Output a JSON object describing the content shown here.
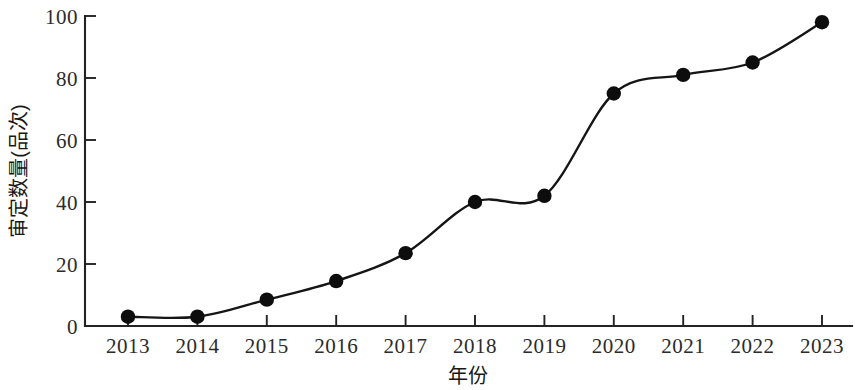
{
  "chart_data": {
    "type": "line",
    "title": "",
    "subtitle": "",
    "xlabel": "年份",
    "ylabel": "审定数量(品次)",
    "categories": [
      "2013",
      "2014",
      "2015",
      "2016",
      "2017",
      "2018",
      "2019",
      "2020",
      "2021",
      "2022",
      "2023"
    ],
    "values": [
      3,
      3,
      8.5,
      14.5,
      23.5,
      40,
      42,
      75,
      81,
      85,
      98
    ],
    "series": [
      {
        "name": "审定数量",
        "values": [
          3,
          3,
          8.5,
          14.5,
          23.5,
          40,
          42,
          75,
          81,
          85,
          98
        ]
      }
    ],
    "x_tick_labels": [
      "2013",
      "2014",
      "2015",
      "2016",
      "2017",
      "2018",
      "2019",
      "2020",
      "2021",
      "2022",
      "2023"
    ],
    "y_tick_labels": [
      "0",
      "20",
      "40",
      "60",
      "80",
      "100"
    ],
    "y_ticks": [
      0,
      20,
      40,
      60,
      80,
      100
    ],
    "ylim": [
      0,
      100
    ],
    "grid": false,
    "legend": false,
    "legend_position": "none",
    "marker": "circle",
    "marker_color": "#0d0d0d",
    "line_color": "#151515",
    "smooth": true
  },
  "axes": {
    "y_axis_title": "审定数量(品次)",
    "x_axis_title": "年份"
  }
}
